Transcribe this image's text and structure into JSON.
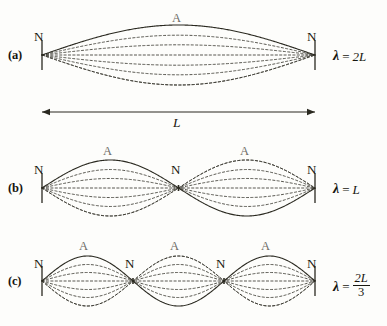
{
  "figure": {
    "background_color": "#fdfdfb",
    "ink_color": "#17160f",
    "muted_ink_color": "#6d6c66",
    "caption": ""
  },
  "geometry": {
    "string_left_x": 42,
    "string_right_x": 315,
    "canvas_width": 387,
    "canvas_height": 326
  },
  "length_arrow": {
    "label": "L",
    "y": 112,
    "x_start": 42,
    "x_end": 315
  },
  "panels": [
    {
      "id": "a",
      "id_label": "(a)",
      "harmonic": 1,
      "loops": 1,
      "axis_y": 55,
      "amplitude": 30,
      "wavelength_label": {
        "lambda": "λ",
        "equals": "=",
        "value": "2L",
        "is_fraction": false,
        "numerator": "",
        "denominator": ""
      },
      "node_labels": [
        {
          "text": "N",
          "x": 34,
          "y": 30
        },
        {
          "text": "N",
          "x": 307,
          "y": 30
        }
      ],
      "antinode_labels": [
        {
          "text": "A",
          "x": 172,
          "y": 12
        }
      ]
    },
    {
      "id": "b",
      "id_label": "(b)",
      "harmonic": 2,
      "loops": 2,
      "axis_y": 188,
      "amplitude": 28,
      "wavelength_label": {
        "lambda": "λ",
        "equals": "=",
        "value": "L",
        "is_fraction": false,
        "numerator": "",
        "denominator": ""
      },
      "node_labels": [
        {
          "text": "N",
          "x": 34,
          "y": 163
        },
        {
          "text": "N",
          "x": 171,
          "y": 163
        },
        {
          "text": "N",
          "x": 307,
          "y": 163
        }
      ],
      "antinode_labels": [
        {
          "text": "A",
          "x": 103,
          "y": 145
        },
        {
          "text": "A",
          "x": 240,
          "y": 145
        }
      ]
    },
    {
      "id": "c",
      "id_label": "(c)",
      "harmonic": 3,
      "loops": 3,
      "axis_y": 281,
      "amplitude": 25,
      "wavelength_label": {
        "lambda": "λ",
        "equals": "=",
        "value": "",
        "is_fraction": true,
        "numerator": "2L",
        "denominator": "3"
      },
      "node_labels": [
        {
          "text": "N",
          "x": 34,
          "y": 257
        },
        {
          "text": "N",
          "x": 125,
          "y": 257
        },
        {
          "text": "N",
          "x": 216,
          "y": 257
        },
        {
          "text": "N",
          "x": 307,
          "y": 257
        }
      ],
      "antinode_labels": [
        {
          "text": "A",
          "x": 79,
          "y": 240
        },
        {
          "text": "A",
          "x": 170,
          "y": 240
        },
        {
          "text": "A",
          "x": 261,
          "y": 240
        }
      ]
    }
  ],
  "wave_render": {
    "solid_fraction": 1.0,
    "dashed_fractions": [
      0.66,
      0.34,
      0.0,
      -0.34,
      -0.66,
      -1.0
    ],
    "solid_color": "#2a2920",
    "dashed_color": "#3b3a31",
    "solid_width": 1.1,
    "dashed_width": 0.85,
    "dash_pattern": "2.2 2.2"
  },
  "chart_data": {
    "type": "line",
    "xlabel": "",
    "ylabel": "",
    "x": [
      0,
      1
    ],
    "series": [
      {
        "name": "(a) fundamental, n=1, λ = 2L",
        "loops": 1,
        "wavelength": "2L"
      },
      {
        "name": "(b) second harmonic, n=2, λ = L",
        "loops": 2,
        "wavelength": "L"
      },
      {
        "name": "(c) third harmonic, n=3, λ = 2L/3",
        "loops": 3,
        "wavelength": "2L/3"
      }
    ],
    "annotations": [
      "N",
      "A",
      "L"
    ],
    "grid": false,
    "legend": "none"
  }
}
